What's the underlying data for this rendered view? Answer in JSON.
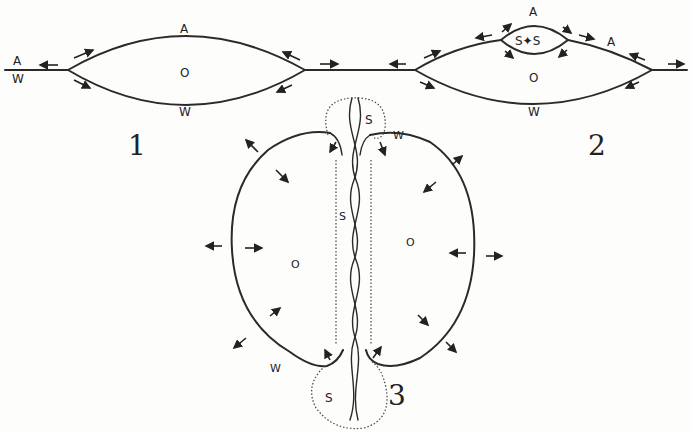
{
  "figures": [
    {
      "number": "1",
      "labels": {
        "air_left": "A",
        "water_left": "W",
        "air_top": "A",
        "oil_center": "O",
        "water_bottom": "W"
      }
    },
    {
      "number": "2",
      "labels": {
        "air_top": "A",
        "surfactant_lens": "S✦S",
        "air_right": "A",
        "oil_center": "O",
        "water_bottom": "W"
      }
    },
    {
      "number": "3",
      "labels": {
        "s_top": "S",
        "w_top": "W",
        "s_middle": "S",
        "o_left": "O",
        "o_right": "O",
        "w_bottom": "W",
        "s_bottom": "S"
      }
    }
  ],
  "colors": {
    "ink": "#2a2a2a",
    "paper": "#fdfdfc"
  }
}
